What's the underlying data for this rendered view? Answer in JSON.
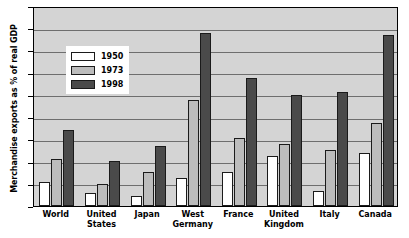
{
  "chart_data": {
    "type": "bar",
    "title": "",
    "subtitle": "",
    "xlabel": "",
    "ylabel": "Merchandise exports as % of real GDP",
    "ylim": [
      0,
      45
    ],
    "ytick_values": [
      0,
      5,
      10,
      15,
      20,
      25,
      30,
      35,
      40,
      45
    ],
    "ytick_labels": [
      "0",
      "5",
      "10",
      "15",
      "20",
      "25",
      "30",
      "35",
      "40",
      "45"
    ],
    "grid": "horizontal",
    "legend_position": "upper-left-inset",
    "categories": [
      "World",
      "United States",
      "Japan",
      "West Germany",
      "France",
      "United Kingdom",
      "Italy",
      "Canada"
    ],
    "category_lines": [
      [
        "World"
      ],
      [
        "United",
        "States"
      ],
      [
        "Japan"
      ],
      [
        "West",
        "Germany"
      ],
      [
        "France"
      ],
      [
        "United",
        "Kingdom"
      ],
      [
        "Italy"
      ],
      [
        "Canada"
      ]
    ],
    "series": [
      {
        "name": "1950",
        "color": "#ffffff",
        "values": [
          5.5,
          3.0,
          2.2,
          6.2,
          7.6,
          11.3,
          3.3,
          12.0
        ]
      },
      {
        "name": "1973",
        "color": "#bcbcbc",
        "values": [
          10.5,
          4.9,
          7.7,
          23.8,
          15.2,
          14.0,
          12.5,
          18.6
        ]
      },
      {
        "name": "1998",
        "color": "#4a4a4a",
        "values": [
          17.2,
          10.1,
          13.4,
          38.9,
          28.7,
          25.0,
          25.7,
          38.5
        ]
      }
    ]
  },
  "colors": {
    "plot_background": "#d4d4d4",
    "gridline": "#6e6e6e",
    "axis": "#000000",
    "legend_background": "#ffffff",
    "series_1950": "#ffffff",
    "series_1973": "#bcbcbc",
    "series_1998": "#4a4a4a"
  }
}
